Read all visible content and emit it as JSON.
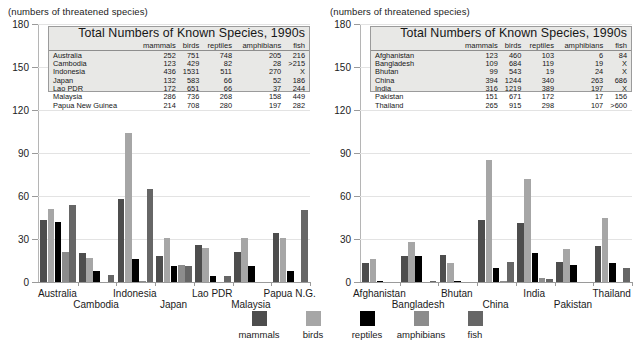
{
  "caption": "(numbers of threatened species)",
  "legend": {
    "items": [
      {
        "label": "mammals",
        "color": "#4d4d4d"
      },
      {
        "label": "birds",
        "color": "#a6a6a6"
      },
      {
        "label": "reptiles",
        "color": "#000000"
      },
      {
        "label": "amphibians",
        "color": "#8c8c8c"
      },
      {
        "label": "fish",
        "color": "#666666"
      }
    ]
  },
  "left_table": {
    "title": "Total Numbers of Known Species, 1990s",
    "columns": [
      "mammals",
      "birds",
      "reptiles",
      "amphibians",
      "fish"
    ],
    "rows": [
      {
        "name": "Australia",
        "values": [
          "252",
          "751",
          "748",
          "205",
          "216"
        ]
      },
      {
        "name": "Cambodia",
        "values": [
          "123",
          "429",
          "82",
          "28",
          ">215"
        ]
      },
      {
        "name": "Indonesia",
        "values": [
          "436",
          "1531",
          "511",
          "270",
          "X"
        ]
      },
      {
        "name": "Japan",
        "values": [
          "132",
          "583",
          "66",
          "52",
          "186"
        ]
      },
      {
        "name": "Lao PDR",
        "values": [
          "172",
          "651",
          "66",
          "37",
          "244"
        ]
      },
      {
        "name": "Malaysia",
        "values": [
          "286",
          "736",
          "268",
          "158",
          "449"
        ]
      },
      {
        "name": "Papua New Guinea",
        "values": [
          "214",
          "708",
          "280",
          "197",
          "282"
        ]
      }
    ]
  },
  "right_table": {
    "title": "Total Numbers of Known Species, 1990s",
    "columns": [
      "mammals",
      "birds",
      "reptiles",
      "amphibians",
      "fish"
    ],
    "rows": [
      {
        "name": "Afghanistan",
        "values": [
          "123",
          "460",
          "103",
          "6",
          "84"
        ]
      },
      {
        "name": "Bangladesh",
        "values": [
          "109",
          "684",
          "119",
          "19",
          "X"
        ]
      },
      {
        "name": "Bhutan",
        "values": [
          "99",
          "543",
          "19",
          "24",
          "X"
        ]
      },
      {
        "name": "China",
        "values": [
          "394",
          "1244",
          "340",
          "263",
          "686"
        ]
      },
      {
        "name": "India",
        "values": [
          "316",
          "1219",
          "389",
          "197",
          "X"
        ]
      },
      {
        "name": "Pakistan",
        "values": [
          "151",
          "671",
          "172",
          "17",
          "156"
        ]
      },
      {
        "name": "Thailand",
        "values": [
          "265",
          "915",
          "298",
          "107",
          ">600"
        ]
      }
    ]
  },
  "chart_data": [
    {
      "type": "bar",
      "title": "",
      "xlabel": "",
      "ylabel": "(numbers of threatened species)",
      "ylim": [
        0,
        180
      ],
      "yticks": [
        0,
        30,
        60,
        90,
        120,
        150,
        180
      ],
      "grid": true,
      "legend_position": "bottom",
      "categories": [
        "Australia",
        "Cambodia",
        "Indonesia",
        "Japan",
        "Lao PDR",
        "Malaysia",
        "Papua N.G."
      ],
      "series": [
        {
          "name": "mammals",
          "color": "#4d4d4d",
          "values": [
            43,
            20,
            58,
            18,
            26,
            21,
            34
          ]
        },
        {
          "name": "birds",
          "color": "#a6a6a6",
          "values": [
            51,
            17,
            104,
            31,
            24,
            31,
            31
          ]
        },
        {
          "name": "reptiles",
          "color": "#000000",
          "values": [
            42,
            8,
            16,
            11,
            4,
            11,
            8
          ]
        },
        {
          "name": "amphibians",
          "color": "#8c8c8c",
          "values": [
            21,
            0,
            1,
            12,
            0,
            0,
            0
          ]
        },
        {
          "name": "fish",
          "color": "#666666",
          "values": [
            54,
            5,
            65,
            11,
            4,
            0,
            50
          ]
        }
      ]
    },
    {
      "type": "bar",
      "title": "",
      "xlabel": "",
      "ylabel": "(numbers of threatened species)",
      "ylim": [
        0,
        180
      ],
      "yticks": [
        0,
        30,
        60,
        90,
        120,
        150,
        180
      ],
      "grid": true,
      "legend_position": "bottom",
      "categories": [
        "Afghanistan",
        "Bangladesh",
        "Bhutan",
        "China",
        "India",
        "Pakistan",
        "Thailand"
      ],
      "series": [
        {
          "name": "mammals",
          "color": "#4d4d4d",
          "values": [
            13,
            18,
            19,
            43,
            41,
            14,
            25
          ]
        },
        {
          "name": "birds",
          "color": "#a6a6a6",
          "values": [
            16,
            28,
            13,
            85,
            72,
            23,
            45
          ]
        },
        {
          "name": "reptiles",
          "color": "#000000",
          "values": [
            1,
            18,
            1,
            10,
            20,
            12,
            13
          ]
        },
        {
          "name": "amphibians",
          "color": "#8c8c8c",
          "values": [
            0,
            0,
            0,
            1,
            3,
            0,
            0
          ]
        },
        {
          "name": "fish",
          "color": "#666666",
          "values": [
            0,
            1,
            0,
            14,
            2,
            0,
            10
          ]
        }
      ]
    }
  ]
}
